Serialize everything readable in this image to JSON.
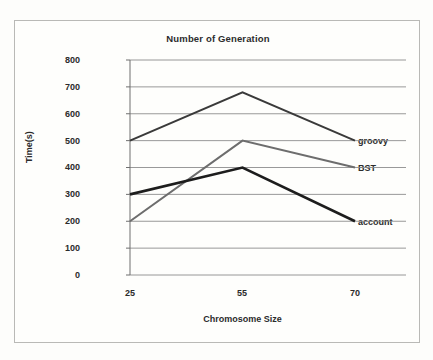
{
  "chart_data": {
    "type": "line",
    "title": "Number of Generation",
    "xlabel": "Chromosome Size",
    "ylabel": "Time(s)",
    "categories": [
      "25",
      "55",
      "70"
    ],
    "x_values": [
      25,
      55,
      70
    ],
    "ylim": [
      0,
      800
    ],
    "ytick_labels": [
      "800",
      "700",
      "600",
      "500",
      "400",
      "300",
      "200",
      "100",
      "0"
    ],
    "ytick_values": [
      800,
      700,
      600,
      500,
      400,
      300,
      200,
      100,
      0
    ],
    "grid": true,
    "legend_position": "right-inline-labels",
    "series": [
      {
        "name": "groovy",
        "label": "groovy",
        "color": "#3a3a3a",
        "width": 2.0,
        "values": [
          500,
          680,
          500
        ]
      },
      {
        "name": "BST",
        "label": "BST",
        "color": "#6d6d6d",
        "width": 2.0,
        "values": [
          200,
          500,
          400
        ]
      },
      {
        "name": "account",
        "label": "account",
        "color": "#1d1d1d",
        "width": 2.6,
        "values": [
          300,
          400,
          200
        ]
      }
    ],
    "colors": {
      "grid": "#8d8d8d",
      "axis": "#6f6f6f",
      "frame": "#b9b9b6",
      "background": "#fefefc",
      "text": "#2b2b2b"
    }
  }
}
